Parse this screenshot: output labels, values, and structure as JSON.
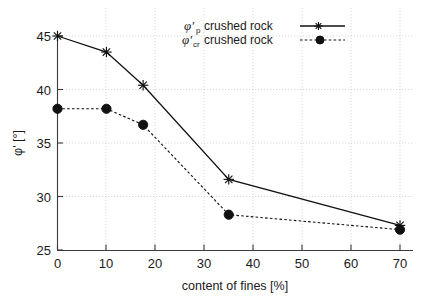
{
  "chart_data": {
    "type": "line",
    "title": "",
    "xlabel": "content of fines [%]",
    "ylabel": "φ' [°]",
    "xlim": [
      0,
      70
    ],
    "ylim": [
      25,
      45
    ],
    "xticks": [
      "0",
      "10",
      "20",
      "30",
      "40",
      "50",
      "60",
      "70"
    ],
    "yticks": [
      "25",
      "30",
      "35",
      "40",
      "45"
    ],
    "grid": true,
    "legend_position": "top-center-right",
    "x": [
      0,
      10,
      17.5,
      35,
      70
    ],
    "series": [
      {
        "name": "φ'p crushed rock",
        "symbol": "φ'",
        "subscript": "p",
        "label_tail": "crushed rock",
        "marker": "star",
        "linestyle": "solid",
        "color": "#111111",
        "values": [
          45.0,
          43.5,
          40.4,
          31.6,
          27.3
        ]
      },
      {
        "name": "φ'cr crushed rock",
        "symbol": "φ'",
        "subscript": "cr",
        "label_tail": "crushed rock",
        "marker": "circle",
        "linestyle": "dashed",
        "color": "#111111",
        "values": [
          38.2,
          38.2,
          36.7,
          28.3,
          26.9
        ]
      }
    ]
  },
  "axes": {
    "x_axis_title": "content of fines [%]",
    "y_axis_title": "φ' [°]",
    "x_tick_labels": [
      "0",
      "10",
      "20",
      "30",
      "40",
      "50",
      "60",
      "70"
    ],
    "y_tick_labels": [
      "25",
      "30",
      "35",
      "40",
      "45"
    ]
  },
  "legend": {
    "entries": [
      {
        "symbol": "φ'",
        "subscript": "p",
        "text": "crushed rock"
      },
      {
        "symbol": "φ'",
        "subscript": "cr",
        "text": "crushed rock"
      }
    ]
  }
}
